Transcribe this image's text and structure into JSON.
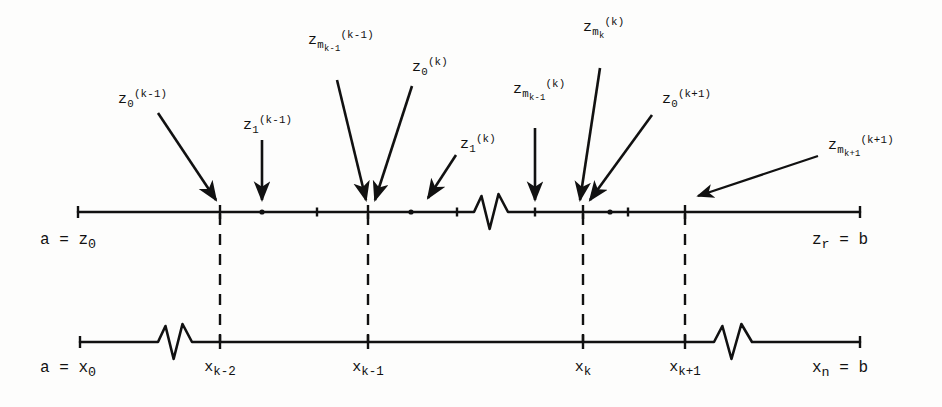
{
  "figure": {
    "ink_color": "#111111",
    "background_color": "#fdfdfc"
  },
  "top_axis": {
    "name": "z-partition-axis",
    "left_label": "a = z",
    "left_label_sub": "0",
    "right_label": "z",
    "right_label_sub": "r",
    "right_label_tail": " = b",
    "start_x": 78,
    "end_x": 860,
    "y": 212,
    "break_start_x": 474,
    "break_end_x": 508,
    "ticks": [
      {
        "x": 78,
        "size": "end"
      },
      {
        "x": 220,
        "size": "tall"
      },
      {
        "x": 262,
        "size": "dot"
      },
      {
        "x": 317,
        "size": "small"
      },
      {
        "x": 368,
        "size": "tall"
      },
      {
        "x": 411,
        "size": "dot"
      },
      {
        "x": 457,
        "size": "small"
      },
      {
        "x": 535,
        "size": "small"
      },
      {
        "x": 583,
        "size": "tall"
      },
      {
        "x": 610,
        "size": "dot"
      },
      {
        "x": 628,
        "size": "small"
      },
      {
        "x": 685,
        "size": "tall"
      },
      {
        "x": 860,
        "size": "end"
      }
    ]
  },
  "bottom_axis": {
    "name": "x-partition-axis",
    "left_label": "a = x",
    "left_label_sub": "0",
    "right_label": "x",
    "right_label_sub": "n",
    "right_label_tail": " = b",
    "start_x": 80,
    "end_x": 860,
    "y": 342,
    "break_1_start_x": 158,
    "break_1_end_x": 192,
    "break_2_start_x": 714,
    "break_2_end_x": 752,
    "ticks": [
      {
        "x": 80,
        "label": "",
        "size": "end"
      },
      {
        "x": 220,
        "label": "x_{k-2}",
        "size": "tall"
      },
      {
        "x": 368,
        "label": "x_{k-1}",
        "size": "tall"
      },
      {
        "x": 583,
        "label": "x_k",
        "size": "tall"
      },
      {
        "x": 685,
        "label": "x_{k+1}",
        "size": "tall"
      },
      {
        "x": 860,
        "label": "",
        "size": "end"
      }
    ],
    "tick_labels": [
      {
        "x": 220,
        "y": 360,
        "base": "x",
        "sub": "k-2"
      },
      {
        "x": 368,
        "y": 360,
        "base": "x",
        "sub": "k-1"
      },
      {
        "x": 583,
        "y": 360,
        "base": "x",
        "sub": "k"
      },
      {
        "x": 685,
        "y": 360,
        "base": "x",
        "sub": "k+1"
      }
    ]
  },
  "connectors": [
    {
      "name": "dashed-connector-left",
      "x": 220,
      "y_top": 214,
      "y_bottom": 342
    },
    {
      "name": "dashed-connector-midleft",
      "x": 368,
      "y_top": 214,
      "y_bottom": 342
    },
    {
      "name": "dashed-connector-midright",
      "x": 583,
      "y_top": 214,
      "y_bottom": 342
    },
    {
      "name": "dashed-connector-right",
      "x": 685,
      "y_top": 214,
      "y_bottom": 342
    }
  ],
  "annotations": [
    {
      "name": "annotation-z0-k-minus-1",
      "base": "z",
      "sub": "0",
      "sup": "(k-1)",
      "label_x": 118,
      "label_y": 92,
      "arrow": {
        "x1": 158,
        "y1": 113,
        "x2": 216,
        "y2": 200,
        "head": "diagonal"
      }
    },
    {
      "name": "annotation-z1-k-minus-1",
      "base": "z",
      "sub": "1",
      "sup": "(k-1)",
      "label_x": 243,
      "label_y": 118,
      "arrow": {
        "x1": 262,
        "y1": 140,
        "x2": 262,
        "y2": 200,
        "head": "vertical"
      }
    },
    {
      "name": "annotation-zm-k-minus-1-sup-k-minus-1",
      "base": "z",
      "sub": "m",
      "subsub": "k-1",
      "sup": "(k-1)",
      "label_x": 308,
      "label_y": 33,
      "arrow": {
        "x1": 337,
        "y1": 80,
        "x2": 366,
        "y2": 200,
        "head": "diagonal"
      }
    },
    {
      "name": "annotation-z0-k",
      "base": "z",
      "sub": "0",
      "sup": "(k)",
      "label_x": 412,
      "label_y": 60,
      "arrow": {
        "x1": 412,
        "y1": 86,
        "x2": 375,
        "y2": 200,
        "head": "diagonal"
      }
    },
    {
      "name": "annotation-z1-k",
      "base": "z",
      "sub": "1",
      "sup": "(k)",
      "label_x": 460,
      "label_y": 137,
      "arrow": {
        "x1": 456,
        "y1": 155,
        "x2": 428,
        "y2": 198,
        "head": "diagonal"
      }
    },
    {
      "name": "annotation-zm-k-minus-1-sup-k",
      "base": "z",
      "sub": "m",
      "subsub": "k-1",
      "sup": "(k)",
      "label_x": 513,
      "label_y": 82,
      "arrow": {
        "x1": 535,
        "y1": 128,
        "x2": 535,
        "y2": 200,
        "head": "vertical"
      }
    },
    {
      "name": "annotation-zm-k-sup-k",
      "base": "z",
      "sub": "m",
      "subsub": "k",
      "sup": "(k)",
      "label_x": 583,
      "label_y": 20,
      "arrow": {
        "x1": 600,
        "y1": 68,
        "x2": 580,
        "y2": 200,
        "head": "diagonal"
      }
    },
    {
      "name": "annotation-z0-k-plus-1",
      "base": "z",
      "sub": "0",
      "sup": "(k+1)",
      "label_x": 662,
      "label_y": 92,
      "arrow": {
        "x1": 652,
        "y1": 115,
        "x2": 590,
        "y2": 200,
        "head": "diagonal"
      }
    },
    {
      "name": "annotation-zm-k-plus-1-sup-k-plus-1",
      "base": "z",
      "sub": "m",
      "subsub": "k+1",
      "sup": "(k+1)",
      "label_x": 828,
      "label_y": 138,
      "arrow": {
        "x1": 818,
        "y1": 156,
        "x2": 698,
        "y2": 196,
        "head": "shallow"
      }
    }
  ]
}
